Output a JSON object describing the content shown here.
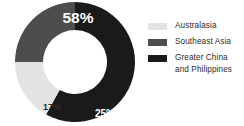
{
  "chart_data": {
    "type": "pie",
    "title": "",
    "subtitle": "",
    "xlabel": "",
    "ylabel": "",
    "variant": "donut",
    "legend_position": "right",
    "grid": false,
    "categories": [
      "Australasia",
      "Southeast Asia",
      "Greater China and Philippines"
    ],
    "values": [
      17,
      25,
      58
    ],
    "value_labels": [
      "17%",
      "25%",
      "58%"
    ],
    "colors": [
      "#e3e3e3",
      "#4d4d4d",
      "#1a1a1a"
    ],
    "slices": [
      {
        "name": "Greater China and Philippines",
        "value": 58,
        "label": "58%",
        "color": "#1a1a1a",
        "label_color": "#ffffff"
      },
      {
        "name": "Southeast Asia",
        "value": 25,
        "label": "25%",
        "color": "#4d4d4d",
        "label_color": "#ffffff"
      },
      {
        "name": "Australasia",
        "value": 17,
        "label": "17%",
        "color": "#e3e3e3",
        "label_color": "#2b2b2b"
      }
    ]
  },
  "legend": {
    "items": [
      {
        "label": "Australasia",
        "color": "#e3e3e3"
      },
      {
        "label": "Southeast Asia",
        "color": "#4d4d4d"
      },
      {
        "label": "Greater China\nand Philippines",
        "color": "#1a1a1a"
      }
    ]
  },
  "labels": {
    "big": "58%",
    "medium": "25%",
    "small": "17%"
  }
}
